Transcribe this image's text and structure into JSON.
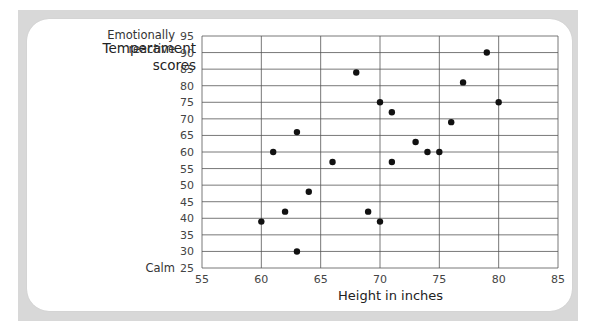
{
  "chart_data": {
    "type": "scatter",
    "title": "",
    "xlabel": "Height in inches",
    "ylabel": "Temperament scores",
    "ylabel_top_annotation": "Emotionally reactive",
    "ylabel_bottom_annotation": "Calm",
    "xlim": [
      55,
      85
    ],
    "ylim": [
      25,
      95
    ],
    "x_ticks": [
      55,
      60,
      65,
      70,
      75,
      80,
      85
    ],
    "y_ticks": [
      25,
      30,
      35,
      40,
      45,
      50,
      55,
      60,
      65,
      70,
      75,
      80,
      85,
      90,
      95
    ],
    "grid": true,
    "legend": null,
    "points": [
      {
        "x": 60,
        "y": 39
      },
      {
        "x": 61,
        "y": 60
      },
      {
        "x": 62,
        "y": 42
      },
      {
        "x": 63,
        "y": 66
      },
      {
        "x": 63,
        "y": 30
      },
      {
        "x": 64,
        "y": 48
      },
      {
        "x": 66,
        "y": 57
      },
      {
        "x": 68,
        "y": 84
      },
      {
        "x": 69,
        "y": 42
      },
      {
        "x": 70,
        "y": 39
      },
      {
        "x": 70,
        "y": 75
      },
      {
        "x": 71,
        "y": 72
      },
      {
        "x": 71,
        "y": 57
      },
      {
        "x": 73,
        "y": 63
      },
      {
        "x": 74,
        "y": 60
      },
      {
        "x": 75,
        "y": 60
      },
      {
        "x": 76,
        "y": 69
      },
      {
        "x": 77,
        "y": 81
      },
      {
        "x": 79,
        "y": 90
      },
      {
        "x": 80,
        "y": 75
      }
    ]
  },
  "labels": {
    "ylabel_line1": "Temperament",
    "ylabel_line2": "scores",
    "top_line1": "Emotionally",
    "top_line2": "reactive",
    "bottom": "Calm",
    "xlabel": "Height in inches"
  },
  "colors": {
    "frame": "#d8d8d8",
    "grid": "#555555",
    "point": "#111111",
    "tick_text": "#444444"
  }
}
